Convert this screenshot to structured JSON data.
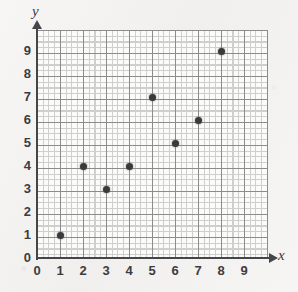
{
  "chart_data": {
    "type": "scatter",
    "title": "",
    "xlabel": "x",
    "ylabel": "y",
    "xlim": [
      0,
      9
    ],
    "ylim": [
      0,
      9
    ],
    "grid": true,
    "minor_grid": true,
    "minor_ticks_per_unit": 4,
    "legend": "none",
    "x_tick_labels": [
      "0",
      "1",
      "2",
      "3",
      "4",
      "5",
      "6",
      "7",
      "8",
      "9"
    ],
    "y_tick_labels": [
      "0",
      "1",
      "2",
      "3",
      "4",
      "5",
      "6",
      "7",
      "8",
      "9"
    ],
    "point_color": "#3a3a3c",
    "axis_color": "#46464a",
    "grid_major_color": "#8c8c8c",
    "grid_minor_color": "#cfcfcd",
    "plot_background": "#fbfbfa",
    "paper_background": "#f2f1ef",
    "points": [
      {
        "x": 1,
        "y": 1
      },
      {
        "x": 2,
        "y": 4
      },
      {
        "x": 3,
        "y": 3
      },
      {
        "x": 4,
        "y": 4
      },
      {
        "x": 5,
        "y": 7
      },
      {
        "x": 6,
        "y": 5
      },
      {
        "x": 7,
        "y": 6
      },
      {
        "x": 8,
        "y": 9
      }
    ]
  }
}
